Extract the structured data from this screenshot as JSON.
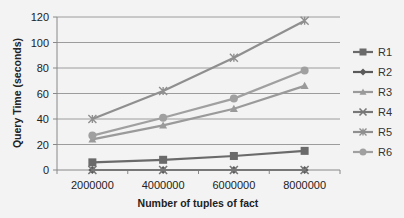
{
  "chart_data": {
    "type": "line",
    "title": "",
    "xlabel": "Number of tuples of fact",
    "ylabel": "Query Time (seconds)",
    "x": [
      2000000,
      4000000,
      6000000,
      8000000
    ],
    "categories": [
      "2000000",
      "4000000",
      "6000000",
      "8000000"
    ],
    "ylim": [
      0,
      120
    ],
    "yticks": [
      0,
      20,
      40,
      60,
      80,
      100,
      120
    ],
    "grid": true,
    "legend_position": "right",
    "series": [
      {
        "name": "R1",
        "marker": "square",
        "color": "#6a6a6a",
        "values": [
          6,
          8,
          11,
          15
        ]
      },
      {
        "name": "R2",
        "marker": "diamond",
        "color": "#5a5a5a",
        "values": [
          0,
          0,
          0,
          0
        ]
      },
      {
        "name": "R3",
        "marker": "triangle",
        "color": "#9a9a9a",
        "values": [
          24,
          35,
          48,
          66
        ]
      },
      {
        "name": "R4",
        "marker": "x",
        "color": "#777777",
        "values": [
          0,
          0,
          0,
          0
        ]
      },
      {
        "name": "R5",
        "marker": "star",
        "color": "#8f8f8f",
        "values": [
          40,
          62,
          88,
          117
        ]
      },
      {
        "name": "R6",
        "marker": "circle",
        "color": "#a0a0a0",
        "values": [
          27,
          41,
          56,
          78
        ]
      }
    ]
  },
  "ytick_labels": [
    "0",
    "20",
    "40",
    "60",
    "80",
    "100",
    "120"
  ]
}
